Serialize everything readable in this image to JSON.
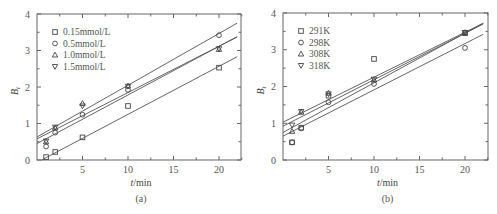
{
  "chart_data": [
    {
      "type": "scatter",
      "panel": "(a)",
      "caption": "(a)",
      "xlabel": "t/min",
      "ylabel": "Bt",
      "xlim": [
        0,
        22.5
      ],
      "ylim": [
        0,
        4
      ],
      "xticks": [
        5,
        10,
        15,
        20
      ],
      "yticks": [
        0,
        1,
        2,
        3,
        4
      ],
      "grid": false,
      "legend_position": "upper left",
      "fit_lines": true,
      "series": [
        {
          "name": "0.15mmol/L",
          "marker": "square",
          "x": [
            1,
            2,
            5,
            10,
            20
          ],
          "y": [
            0.08,
            0.22,
            0.62,
            1.48,
            2.53
          ],
          "fit": [
            [
              0.5,
              0.0
            ],
            [
              22,
              2.83
            ]
          ]
        },
        {
          "name": "0.5mmol/L",
          "marker": "circle",
          "x": [
            1,
            2,
            5,
            10,
            20
          ],
          "y": [
            0.37,
            0.75,
            1.24,
            1.92,
            3.42
          ],
          "fit": [
            [
              0,
              0.45
            ],
            [
              22,
              3.38
            ]
          ]
        },
        {
          "name": "1.0mmol/L",
          "marker": "triangle-up",
          "x": [
            1,
            2,
            5,
            10,
            20
          ],
          "y": [
            0.5,
            0.88,
            1.55,
            2.03,
            3.03
          ],
          "fit": [
            [
              0,
              0.58
            ],
            [
              22,
              3.37
            ]
          ]
        },
        {
          "name": "1.5mmol/L",
          "marker": "triangle-down",
          "x": [
            1,
            2,
            5,
            10,
            20
          ],
          "y": [
            0.52,
            0.9,
            1.48,
            2.02,
            3.05
          ],
          "fit": [
            [
              0,
              0.63
            ],
            [
              22,
              3.75
            ]
          ]
        }
      ]
    },
    {
      "type": "scatter",
      "panel": "(b)",
      "caption": "(b)",
      "xlabel": "t/min",
      "ylabel": "Bt",
      "xlim": [
        0,
        22.5
      ],
      "ylim": [
        0,
        4
      ],
      "xticks": [
        5,
        10,
        15,
        20
      ],
      "yticks": [
        0,
        1,
        2,
        3,
        4
      ],
      "grid": false,
      "legend_position": "upper left",
      "fit_lines": true,
      "series": [
        {
          "name": "291K",
          "marker": "square",
          "x": [
            1,
            2,
            5,
            10,
            20
          ],
          "y": [
            0.48,
            0.88,
            1.75,
            2.75,
            3.45
          ],
          "fit": [
            [
              0,
              0.75
            ],
            [
              22,
              3.72
            ]
          ]
        },
        {
          "name": "298K",
          "marker": "circle",
          "x": [
            1,
            2,
            5,
            10,
            20
          ],
          "y": [
            0.48,
            0.86,
            1.57,
            2.07,
            3.05
          ],
          "fit": [
            [
              0,
              0.65
            ],
            [
              22,
              3.42
            ]
          ]
        },
        {
          "name": "308K",
          "marker": "triangle-up",
          "x": [
            1,
            2,
            5,
            10,
            20
          ],
          "y": [
            0.78,
            1.3,
            1.82,
            2.18,
            3.47
          ],
          "fit": [
            [
              0,
              0.92
            ],
            [
              22,
              3.7
            ]
          ]
        },
        {
          "name": "318K",
          "marker": "triangle-down",
          "x": [
            1,
            2,
            5,
            10,
            20
          ],
          "y": [
            0.95,
            1.32,
            1.8,
            2.2,
            3.47
          ],
          "fit": [
            [
              0,
              1.03
            ],
            [
              22,
              3.72
            ]
          ]
        }
      ]
    }
  ]
}
